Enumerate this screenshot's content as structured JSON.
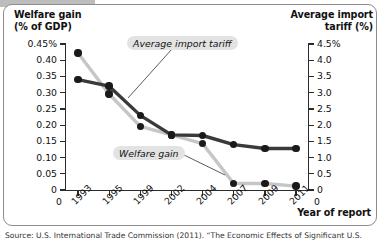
{
  "chart_data": {
    "type": "line",
    "title": "",
    "xlabel": "Year of report",
    "categories": [
      "1993",
      "1995",
      "1999",
      "2002",
      "2004",
      "2007",
      "2009",
      "2011"
    ],
    "left_axis": {
      "label_line1": "Welfare gain",
      "label_line2": "(% of GDP)",
      "ticks": [
        "0.45%",
        "0.40",
        "0.35",
        "0.30",
        "0.25",
        "0.20",
        "0.15",
        "0.10",
        "0.05",
        "0"
      ],
      "values": [
        0.45,
        0.4,
        0.35,
        0.3,
        0.25,
        0.2,
        0.15,
        0.1,
        0.05,
        0
      ],
      "ylim": [
        0,
        0.45
      ]
    },
    "right_axis": {
      "label_line1": "Average import",
      "label_line2": "tariff (%)",
      "ticks": [
        "4.5%",
        "4.0",
        "3.5",
        "3.0",
        "2.5",
        "2.0",
        "1.5",
        "1.0",
        "0.5",
        "0"
      ],
      "values": [
        4.5,
        4.0,
        3.5,
        3.0,
        2.5,
        2.0,
        1.5,
        1.0,
        0.5,
        0
      ],
      "ylim": [
        0,
        4.5
      ]
    },
    "grid": false,
    "legend_position": "inline-callouts",
    "series": [
      {
        "name": "Welfare gain",
        "axis": "left",
        "unit": "% of GDP",
        "color": "#333333",
        "values": [
          0.34,
          0.32,
          0.23,
          0.17,
          0.168,
          0.14,
          0.128,
          0.128
        ]
      },
      {
        "name": "Average import tariff",
        "axis": "right",
        "unit": "%",
        "color": "#c4c4c4",
        "values": [
          4.22,
          2.96,
          1.96,
          1.7,
          1.43,
          0.2,
          0.2,
          0.12
        ]
      }
    ],
    "annotations": [
      {
        "text": "Average import tariff",
        "target_series": "Average import tariff"
      },
      {
        "text": "Welfare gain",
        "target_series": "Welfare gain"
      }
    ]
  },
  "source": {
    "text": "Source: U.S. International Trade Commission (2011). “The Economic Effects of Significant U.S."
  }
}
